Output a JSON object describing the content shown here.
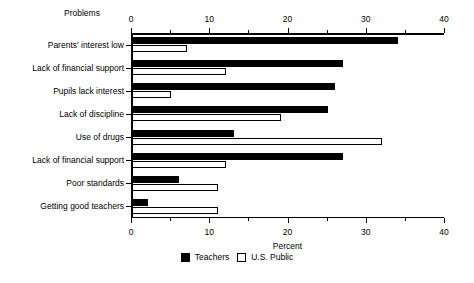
{
  "chart_data": {
    "type": "bar",
    "orientation": "horizontal",
    "title": "",
    "category_axis_title": "Problems",
    "xlabel": "Percent",
    "ylabel": "",
    "xlim": [
      0,
      40
    ],
    "xticks": [
      0,
      10,
      20,
      30,
      40
    ],
    "xtick_labels": [
      "0",
      "10",
      "20",
      "30",
      "40"
    ],
    "minor_tick_interval": 5,
    "grid": false,
    "axis_top": true,
    "axis_bottom": true,
    "legend_position": "bottom-center",
    "categories": [
      "Parents' interest low",
      "Lack of financial support",
      "Pupils lack interest",
      "Lack of discipline",
      "Use of drugs",
      "Lack of financial support",
      "Poor standards",
      "Getting good teachers"
    ],
    "series": [
      {
        "name": "Teachers",
        "color": "#000000",
        "style": "filled",
        "values": [
          34,
          27,
          26,
          25,
          13,
          27,
          6,
          2
        ]
      },
      {
        "name": "U.S. Public",
        "color": "#ffffff",
        "style": "open",
        "values": [
          7,
          12,
          5,
          19,
          32,
          12,
          11,
          11
        ]
      }
    ]
  },
  "legend": {
    "items": [
      {
        "label": "Teachers",
        "swatch": "filled-square"
      },
      {
        "label": "U.S. Public",
        "swatch": "open-square"
      }
    ]
  }
}
